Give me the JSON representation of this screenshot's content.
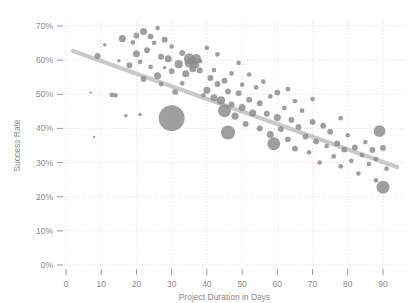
{
  "chart_data": {
    "type": "scatter",
    "title": "",
    "subtitle": "",
    "xlabel": "Project Duration in Days",
    "ylabel": "Success Rate",
    "xlim": [
      0,
      95
    ],
    "ylim": [
      0,
      0.74
    ],
    "grid": true,
    "legend": null,
    "xticks": [
      0,
      10,
      20,
      30,
      40,
      50,
      60,
      70,
      80,
      90
    ],
    "xtick_labels": [
      "0",
      "10",
      "20",
      "30",
      "40",
      "50",
      "60",
      "70",
      "80",
      "90"
    ],
    "yticks": [
      0,
      0.1,
      0.2,
      0.3,
      0.4,
      0.5,
      0.6,
      0.7
    ],
    "ytick_labels": [
      "0%",
      "10%",
      "20%",
      "30%",
      "40%",
      "50%",
      "60%",
      "70%"
    ],
    "marker_color": "#8a8a8a",
    "trendline_color": "#c9c9c9",
    "grid_color": "#e8cfcf",
    "axis_color": "#9a9a9a",
    "bubble_size_note": "Marker area encodes a third variable (project size)",
    "trendline": {
      "type": "linear",
      "x_start": 2,
      "y_start": 0.627,
      "x_end": 94,
      "y_end": 0.287
    },
    "points": [
      {
        "x": 7,
        "y": 0.505,
        "s": 2
      },
      {
        "x": 8,
        "y": 0.375,
        "s": 2
      },
      {
        "x": 9,
        "y": 0.612,
        "s": 5
      },
      {
        "x": 11,
        "y": 0.645,
        "s": 3
      },
      {
        "x": 13,
        "y": 0.498,
        "s": 4
      },
      {
        "x": 14,
        "y": 0.497,
        "s": 4
      },
      {
        "x": 15,
        "y": 0.598,
        "s": 3
      },
      {
        "x": 16,
        "y": 0.663,
        "s": 6
      },
      {
        "x": 17,
        "y": 0.437,
        "s": 3
      },
      {
        "x": 18,
        "y": 0.585,
        "s": 5
      },
      {
        "x": 19,
        "y": 0.652,
        "s": 4
      },
      {
        "x": 20,
        "y": 0.619,
        "s": 6
      },
      {
        "x": 20,
        "y": 0.672,
        "s": 5
      },
      {
        "x": 21,
        "y": 0.441,
        "s": 3
      },
      {
        "x": 21,
        "y": 0.595,
        "s": 4
      },
      {
        "x": 22,
        "y": 0.684,
        "s": 6
      },
      {
        "x": 22,
        "y": 0.545,
        "s": 5
      },
      {
        "x": 23,
        "y": 0.629,
        "s": 5
      },
      {
        "x": 24,
        "y": 0.669,
        "s": 5
      },
      {
        "x": 24,
        "y": 0.58,
        "s": 4
      },
      {
        "x": 25,
        "y": 0.651,
        "s": 4
      },
      {
        "x": 26,
        "y": 0.554,
        "s": 6
      },
      {
        "x": 26,
        "y": 0.694,
        "s": 4
      },
      {
        "x": 27,
        "y": 0.61,
        "s": 5
      },
      {
        "x": 27,
        "y": 0.53,
        "s": 4
      },
      {
        "x": 28,
        "y": 0.578,
        "s": 3
      },
      {
        "x": 28,
        "y": 0.66,
        "s": 5
      },
      {
        "x": 29,
        "y": 0.604,
        "s": 6
      },
      {
        "x": 30,
        "y": 0.43,
        "s": 22
      },
      {
        "x": 30,
        "y": 0.568,
        "s": 5
      },
      {
        "x": 30,
        "y": 0.64,
        "s": 4
      },
      {
        "x": 31,
        "y": 0.507,
        "s": 5
      },
      {
        "x": 32,
        "y": 0.588,
        "s": 7
      },
      {
        "x": 33,
        "y": 0.621,
        "s": 5
      },
      {
        "x": 33,
        "y": 0.532,
        "s": 4
      },
      {
        "x": 34,
        "y": 0.56,
        "s": 6
      },
      {
        "x": 35,
        "y": 0.605,
        "s": 9
      },
      {
        "x": 35,
        "y": 0.592,
        "s": 8
      },
      {
        "x": 36,
        "y": 0.597,
        "s": 7
      },
      {
        "x": 36,
        "y": 0.575,
        "s": 6
      },
      {
        "x": 37,
        "y": 0.604,
        "s": 8
      },
      {
        "x": 37,
        "y": 0.585,
        "s": 5
      },
      {
        "x": 38,
        "y": 0.57,
        "s": 5
      },
      {
        "x": 38,
        "y": 0.597,
        "s": 4
      },
      {
        "x": 39,
        "y": 0.497,
        "s": 4
      },
      {
        "x": 40,
        "y": 0.512,
        "s": 6
      },
      {
        "x": 40,
        "y": 0.636,
        "s": 4
      },
      {
        "x": 41,
        "y": 0.548,
        "s": 5
      },
      {
        "x": 42,
        "y": 0.49,
        "s": 6
      },
      {
        "x": 42,
        "y": 0.571,
        "s": 4
      },
      {
        "x": 43,
        "y": 0.53,
        "s": 5
      },
      {
        "x": 43,
        "y": 0.617,
        "s": 4
      },
      {
        "x": 44,
        "y": 0.482,
        "s": 7
      },
      {
        "x": 45,
        "y": 0.452,
        "s": 11
      },
      {
        "x": 45,
        "y": 0.54,
        "s": 5
      },
      {
        "x": 46,
        "y": 0.388,
        "s": 12
      },
      {
        "x": 46,
        "y": 0.508,
        "s": 5
      },
      {
        "x": 47,
        "y": 0.47,
        "s": 5
      },
      {
        "x": 47,
        "y": 0.561,
        "s": 4
      },
      {
        "x": 48,
        "y": 0.436,
        "s": 6
      },
      {
        "x": 49,
        "y": 0.503,
        "s": 5
      },
      {
        "x": 49,
        "y": 0.592,
        "s": 4
      },
      {
        "x": 50,
        "y": 0.461,
        "s": 6
      },
      {
        "x": 50,
        "y": 0.528,
        "s": 4
      },
      {
        "x": 51,
        "y": 0.413,
        "s": 5
      },
      {
        "x": 52,
        "y": 0.484,
        "s": 5
      },
      {
        "x": 52,
        "y": 0.558,
        "s": 4
      },
      {
        "x": 53,
        "y": 0.445,
        "s": 6
      },
      {
        "x": 54,
        "y": 0.52,
        "s": 4
      },
      {
        "x": 55,
        "y": 0.4,
        "s": 5
      },
      {
        "x": 55,
        "y": 0.474,
        "s": 5
      },
      {
        "x": 56,
        "y": 0.537,
        "s": 4
      },
      {
        "x": 57,
        "y": 0.443,
        "s": 5
      },
      {
        "x": 58,
        "y": 0.382,
        "s": 6
      },
      {
        "x": 58,
        "y": 0.494,
        "s": 4
      },
      {
        "x": 59,
        "y": 0.355,
        "s": 11
      },
      {
        "x": 60,
        "y": 0.432,
        "s": 6
      },
      {
        "x": 60,
        "y": 0.505,
        "s": 5
      },
      {
        "x": 61,
        "y": 0.398,
        "s": 5
      },
      {
        "x": 62,
        "y": 0.46,
        "s": 4
      },
      {
        "x": 63,
        "y": 0.368,
        "s": 5
      },
      {
        "x": 63,
        "y": 0.515,
        "s": 4
      },
      {
        "x": 64,
        "y": 0.425,
        "s": 5
      },
      {
        "x": 65,
        "y": 0.341,
        "s": 5
      },
      {
        "x": 65,
        "y": 0.48,
        "s": 4
      },
      {
        "x": 66,
        "y": 0.404,
        "s": 5
      },
      {
        "x": 67,
        "y": 0.452,
        "s": 4
      },
      {
        "x": 68,
        "y": 0.376,
        "s": 5
      },
      {
        "x": 69,
        "y": 0.33,
        "s": 4
      },
      {
        "x": 70,
        "y": 0.419,
        "s": 5
      },
      {
        "x": 70,
        "y": 0.486,
        "s": 4
      },
      {
        "x": 71,
        "y": 0.362,
        "s": 5
      },
      {
        "x": 72,
        "y": 0.3,
        "s": 4
      },
      {
        "x": 73,
        "y": 0.408,
        "s": 5
      },
      {
        "x": 74,
        "y": 0.348,
        "s": 4
      },
      {
        "x": 75,
        "y": 0.39,
        "s": 5
      },
      {
        "x": 76,
        "y": 0.318,
        "s": 4
      },
      {
        "x": 77,
        "y": 0.356,
        "s": 5
      },
      {
        "x": 78,
        "y": 0.43,
        "s": 4
      },
      {
        "x": 78,
        "y": 0.289,
        "s": 4
      },
      {
        "x": 79,
        "y": 0.338,
        "s": 5
      },
      {
        "x": 80,
        "y": 0.38,
        "s": 4
      },
      {
        "x": 81,
        "y": 0.305,
        "s": 4
      },
      {
        "x": 82,
        "y": 0.344,
        "s": 5
      },
      {
        "x": 83,
        "y": 0.268,
        "s": 4
      },
      {
        "x": 84,
        "y": 0.322,
        "s": 4
      },
      {
        "x": 85,
        "y": 0.36,
        "s": 4
      },
      {
        "x": 86,
        "y": 0.296,
        "s": 4
      },
      {
        "x": 87,
        "y": 0.337,
        "s": 5
      },
      {
        "x": 88,
        "y": 0.248,
        "s": 4
      },
      {
        "x": 88,
        "y": 0.31,
        "s": 4
      },
      {
        "x": 89,
        "y": 0.392,
        "s": 10
      },
      {
        "x": 90,
        "y": 0.228,
        "s": 11
      },
      {
        "x": 90,
        "y": 0.343,
        "s": 5
      },
      {
        "x": 91,
        "y": 0.282,
        "s": 4
      }
    ]
  }
}
